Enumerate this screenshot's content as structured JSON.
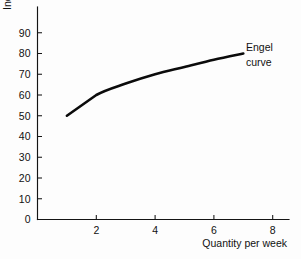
{
  "chart_data": {
    "type": "line",
    "title": "",
    "subtitle": "",
    "xlabel": "Quantity per week",
    "ylabel": "Income (£)",
    "xlim": [
      0,
      8.5
    ],
    "ylim": [
      0,
      97
    ],
    "grid": false,
    "legend": "none",
    "x_ticks": [
      2,
      4,
      6,
      8
    ],
    "x_tick_labels": [
      "2",
      "4",
      "6",
      "8"
    ],
    "y_ticks": [
      0,
      10,
      20,
      30,
      40,
      50,
      60,
      70,
      80,
      90
    ],
    "y_tick_labels": [
      "0",
      "10",
      "20",
      "30",
      "40",
      "50",
      "60",
      "70",
      "80",
      "90"
    ],
    "series": [
      {
        "name": "Engel curve",
        "x": [
          1.0,
          2.0,
          3.0,
          4.0,
          5.0,
          6.0,
          7.0
        ],
        "values": [
          50,
          60,
          65.5,
          70,
          73.5,
          77,
          80
        ]
      }
    ],
    "annotations": [
      {
        "name": "engel-curve-label",
        "lines": [
          "Engel",
          "curve"
        ],
        "x": 7.05,
        "y": 84
      }
    ],
    "colors": {
      "line": "#0b0b0b",
      "axis": "#141414",
      "text": "#111111",
      "background": "#fdfdfd"
    }
  },
  "figure": {
    "x_axis_title": "Quantity per week",
    "y_axis_title": "Income (£)"
  }
}
